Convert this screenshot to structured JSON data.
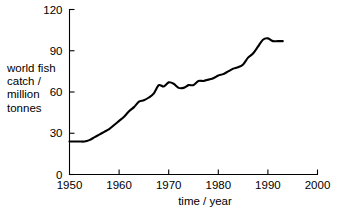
{
  "chart_data": {
    "type": "line",
    "title": "",
    "xlabel": "time / year",
    "ylabel": "world fish catch / million tonnes",
    "ylabel_lines": [
      "world fish",
      "catch /",
      "million",
      "tonnes"
    ],
    "xlim": [
      1950,
      2000
    ],
    "ylim": [
      0,
      120
    ],
    "xticks": [
      1950,
      1960,
      1970,
      1980,
      1990,
      2000
    ],
    "xtick_labels": [
      "1950",
      "1960",
      "1970",
      "1980",
      "1990",
      "2000"
    ],
    "yticks": [
      0,
      30,
      60,
      90,
      120
    ],
    "ytick_labels": [
      "0",
      "30",
      "60",
      "90",
      "120"
    ],
    "grid": false,
    "legend": false,
    "legend_position": "none",
    "line_color": "#000000",
    "axis_color": "#000000",
    "background_color": "#ffffff",
    "series": [
      {
        "name": "world fish catch",
        "units": "million tonnes",
        "x": [
          1950,
          1951,
          1952,
          1953,
          1954,
          1955,
          1956,
          1957,
          1958,
          1959,
          1960,
          1961,
          1962,
          1963,
          1964,
          1965,
          1966,
          1967,
          1968,
          1969,
          1970,
          1971,
          1972,
          1973,
          1974,
          1975,
          1976,
          1977,
          1978,
          1979,
          1980,
          1981,
          1982,
          1983,
          1984,
          1985,
          1986,
          1987,
          1988,
          1989,
          1990,
          1991,
          1992,
          1993
        ],
        "values": [
          24,
          24,
          24,
          24,
          25,
          27,
          29,
          31,
          33,
          36,
          39,
          42,
          46,
          49,
          53,
          54,
          56,
          59,
          65,
          64,
          67,
          66,
          63,
          63,
          65,
          65,
          68,
          68,
          69,
          70,
          72,
          73,
          75,
          77,
          78,
          80,
          85,
          88,
          93,
          98,
          99,
          97,
          97,
          97
        ]
      }
    ]
  }
}
